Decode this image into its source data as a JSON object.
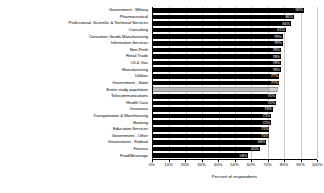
{
  "chart_data": {
    "type": "bar",
    "orientation": "horizontal",
    "title": "",
    "subtitle": "",
    "xlabel": "Percent of respondents",
    "ylabel": "",
    "xlim": [
      0,
      100
    ],
    "xticks": [
      "0%",
      "10%",
      "20%",
      "30%",
      "40%",
      "50%",
      "60%",
      "70%",
      "80%",
      "90%",
      "100%"
    ],
    "xtick_values": [
      0,
      10,
      20,
      30,
      40,
      50,
      60,
      70,
      80,
      90,
      100
    ],
    "grid": true,
    "legend": false,
    "value_labels_suffix": "%",
    "highlight_category": "Entire study population",
    "series_color": "#000000",
    "highlight_color": "#b8b8b8",
    "grid_color": "#c9c9c9",
    "categories": [
      "Government - Military",
      "Pharmaceutical",
      "Professional, Scientific & Technical Services",
      "Consulting",
      "Consumer Goods Manufacturing",
      "Information Services",
      "Non-Profit",
      "Retail Trade",
      "Oil & Gas",
      "Manufacturing",
      "Utilities",
      "Government - State",
      "Entire study population",
      "Telecommunications",
      "Health Care",
      "Insurance",
      "Transportation & Warehousing",
      "Banking",
      "Education Services",
      "Government - Other",
      "Government - Federal",
      "Finance",
      "Food/Beverage"
    ],
    "values": [
      92,
      86,
      84,
      81,
      79,
      79,
      78,
      78,
      78,
      78,
      77,
      77,
      76,
      75,
      75,
      73,
      72,
      72,
      71,
      71,
      69,
      65,
      58
    ],
    "value_labels": [
      "92%",
      "86%",
      "84%",
      "81%",
      "79%",
      "79%",
      "78%",
      "78%",
      "78%",
      "78%",
      "77%",
      "77%",
      "76%",
      "75%",
      "75%",
      "73%",
      "72%",
      "72%",
      "71%",
      "71%",
      "69%",
      "65%",
      "58%"
    ]
  }
}
